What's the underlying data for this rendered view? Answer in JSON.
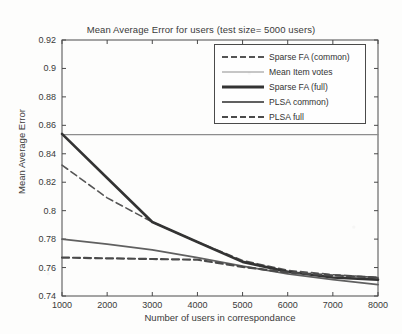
{
  "chart_data": {
    "type": "line",
    "title": "Mean Average Error for users (test size= 5000 users)",
    "xlabel": "Number of users in correspondance",
    "ylabel": "Mean Average Error",
    "xlim": [
      1000,
      8000
    ],
    "ylim": [
      0.74,
      0.92
    ],
    "xticks": [
      1000,
      2000,
      3000,
      4000,
      5000,
      6000,
      7000,
      8000
    ],
    "yticks": [
      "0.74",
      "0.76",
      "0.78",
      "0.8",
      "0.82",
      "0.84",
      "0.86",
      "0.88",
      "0.9",
      "0.92"
    ],
    "grid": false,
    "legend_position": "upper right",
    "x": [
      1000,
      2000,
      3000,
      4000,
      5000,
      6000,
      7000,
      8000
    ],
    "series": [
      {
        "name": "Sparse FA (common)",
        "style": "dashed",
        "width": "thin",
        "color": "#555555",
        "values": [
          0.832,
          0.809,
          0.792,
          0.778,
          0.765,
          0.758,
          0.755,
          0.753
        ]
      },
      {
        "name": "Mean Item votes",
        "style": "solid",
        "width": "light",
        "color": "#8d8d8d",
        "values": [
          0.8535,
          0.8535,
          0.8535,
          0.8535,
          0.8535,
          0.8535,
          0.8535,
          0.8535
        ]
      },
      {
        "name": "Sparse FA (full)",
        "style": "solid",
        "width": "thick",
        "color": "#333333",
        "values": [
          0.854,
          0.823,
          0.792,
          0.778,
          0.764,
          0.757,
          0.753,
          0.7515
        ]
      },
      {
        "name": "PLSA  common)",
        "style": "solid",
        "width": "medium",
        "color": "#606060",
        "values": [
          0.78,
          0.7765,
          0.7725,
          0.767,
          0.761,
          0.7555,
          0.7515,
          0.748
        ]
      },
      {
        "name": "PLSA full",
        "style": "dashed",
        "width": "bold",
        "color": "#4a4a4a",
        "values": [
          0.767,
          0.7665,
          0.766,
          0.7655,
          0.7605,
          0.7565,
          0.7545,
          0.753
        ]
      }
    ]
  },
  "legend": {
    "items": [
      {
        "label": "Sparse FA (common)",
        "sample": "dash-thin"
      },
      {
        "label": "Mean Item votes",
        "sample": "solid-light"
      },
      {
        "label": "Sparse FA (full)",
        "sample": "solid-thick"
      },
      {
        "label": "PLSA  common)",
        "sample": "solid-med"
      },
      {
        "label": "PLSA full",
        "sample": "dash-bold"
      }
    ]
  }
}
